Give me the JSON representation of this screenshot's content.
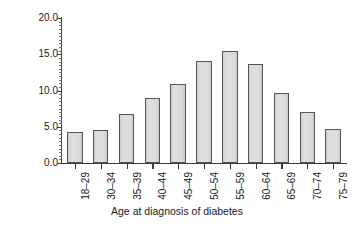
{
  "chart_data": {
    "type": "bar",
    "title": "",
    "xlabel": "Age at diagnosis of diabetes",
    "ylabel": "Percentage",
    "categories": [
      "18–29",
      "30–34",
      "35–39",
      "40–44",
      "45–49",
      "50–54",
      "55–59",
      "60–64",
      "65–69",
      "70–74",
      "75–79"
    ],
    "values": [
      4.3,
      4.6,
      6.8,
      9.0,
      10.9,
      14.1,
      15.4,
      13.7,
      9.6,
      7.0,
      4.7
    ],
    "ylim": [
      0.0,
      20.0
    ],
    "ytick_labels": [
      "0.0",
      "5.0",
      "10.0",
      "15.0",
      "20.0"
    ],
    "ytick_values": [
      0.0,
      5.0,
      10.0,
      15.0,
      20.0
    ],
    "yminor_step": 0.5,
    "grid": false,
    "legend": null,
    "legend_position": "none",
    "bar_fill_color": "#d9d9d9",
    "bar_edge_color": "#555555",
    "axis_color": "#3b3b3b",
    "background_color": "#ffffff"
  }
}
